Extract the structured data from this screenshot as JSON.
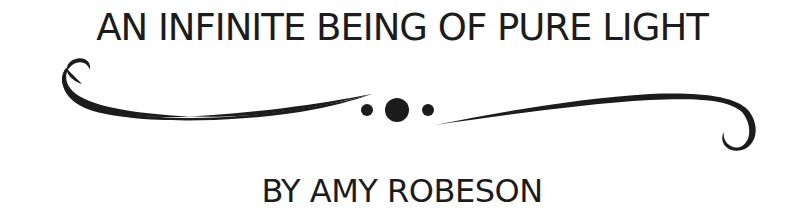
{
  "title": "AN INFINITE BEING OF PURE LIGHT",
  "byline": "BY AMY ROBESON",
  "ornament": {
    "name": "flourish-divider",
    "color": "#1c1c1c"
  }
}
